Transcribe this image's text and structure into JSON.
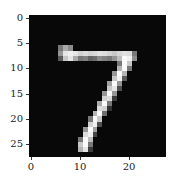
{
  "chart_data": {
    "type": "heatmap",
    "title": "",
    "xlabel": "",
    "ylabel": "",
    "colormap": "gray",
    "shape": [
      28,
      28
    ],
    "xlim": [
      -0.5,
      27.5
    ],
    "ylim": [
      27.5,
      -0.5
    ],
    "xticks": [
      0,
      10,
      20
    ],
    "yticks": [
      0,
      5,
      10,
      15,
      20,
      25
    ],
    "strokes": [
      {
        "row": 6,
        "cols": [
          6,
          7,
          8
        ],
        "values": [
          120,
          170,
          140
        ]
      },
      {
        "row": 7,
        "cols": [
          6,
          7,
          8,
          9,
          10,
          11,
          12,
          13,
          14,
          15,
          16,
          17,
          18,
          19,
          20,
          21
        ],
        "values": [
          150,
          230,
          240,
          230,
          210,
          220,
          210,
          215,
          225,
          220,
          210,
          200,
          215,
          225,
          220,
          120
        ]
      },
      {
        "row": 8,
        "cols": [
          6,
          7,
          8,
          9,
          10,
          11,
          12,
          13,
          14,
          15,
          16,
          17,
          18,
          19,
          20,
          21
        ],
        "values": [
          90,
          200,
          230,
          170,
          120,
          130,
          100,
          110,
          140,
          130,
          120,
          150,
          190,
          250,
          240,
          140
        ]
      },
      {
        "row": 9,
        "cols": [
          18,
          19,
          20
        ],
        "values": [
          120,
          250,
          200
        ]
      },
      {
        "row": 10,
        "cols": [
          18,
          19,
          20
        ],
        "values": [
          180,
          250,
          120
        ]
      },
      {
        "row": 11,
        "cols": [
          17,
          18,
          19
        ],
        "values": [
          150,
          250,
          180
        ]
      },
      {
        "row": 12,
        "cols": [
          17,
          18,
          19
        ],
        "values": [
          200,
          240,
          90
        ]
      },
      {
        "row": 13,
        "cols": [
          16,
          17,
          18
        ],
        "values": [
          160,
          250,
          150
        ]
      },
      {
        "row": 14,
        "cols": [
          16,
          17,
          18
        ],
        "values": [
          200,
          230,
          80
        ]
      },
      {
        "row": 15,
        "cols": [
          15,
          16,
          17
        ],
        "values": [
          150,
          250,
          150
        ]
      },
      {
        "row": 16,
        "cols": [
          15,
          16,
          17
        ],
        "values": [
          210,
          220,
          60
        ]
      },
      {
        "row": 17,
        "cols": [
          14,
          15,
          16
        ],
        "values": [
          170,
          250,
          120
        ]
      },
      {
        "row": 18,
        "cols": [
          14,
          15,
          16
        ],
        "values": [
          220,
          210,
          50
        ]
      },
      {
        "row": 19,
        "cols": [
          13,
          14,
          15
        ],
        "values": [
          180,
          250,
          110
        ]
      },
      {
        "row": 20,
        "cols": [
          12,
          13,
          14
        ],
        "values": [
          120,
          250,
          200
        ]
      },
      {
        "row": 21,
        "cols": [
          12,
          13,
          14
        ],
        "values": [
          210,
          240,
          80
        ]
      },
      {
        "row": 22,
        "cols": [
          11,
          12,
          13
        ],
        "values": [
          150,
          250,
          160
        ]
      },
      {
        "row": 23,
        "cols": [
          11,
          12,
          13
        ],
        "values": [
          220,
          240,
          70
        ]
      },
      {
        "row": 24,
        "cols": [
          10,
          11,
          12
        ],
        "values": [
          120,
          250,
          190
        ]
      },
      {
        "row": 25,
        "cols": [
          10,
          11,
          12
        ],
        "values": [
          200,
          250,
          120
        ]
      },
      {
        "row": 26,
        "cols": [
          10,
          11,
          12
        ],
        "values": [
          180,
          230,
          60
        ]
      }
    ]
  },
  "axes": {
    "yticks": [
      {
        "label": "0",
        "value": 0
      },
      {
        "label": "5",
        "value": 5
      },
      {
        "label": "10",
        "value": 10
      },
      {
        "label": "15",
        "value": 15
      },
      {
        "label": "20",
        "value": 20
      },
      {
        "label": "25",
        "value": 25
      }
    ],
    "xticks": [
      {
        "label": "0",
        "value": 0
      },
      {
        "label": "10",
        "value": 10
      },
      {
        "label": "20",
        "value": 20
      }
    ]
  }
}
